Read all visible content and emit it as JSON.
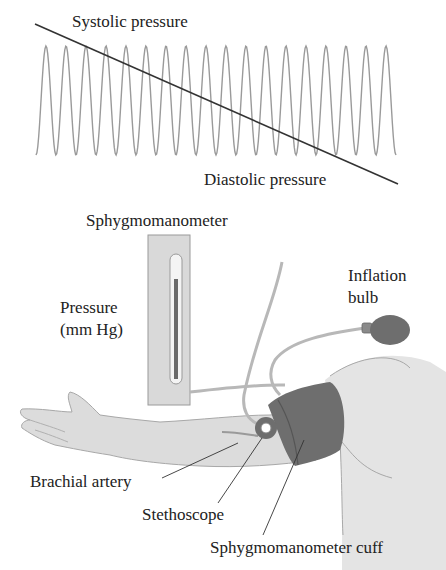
{
  "waveform": {
    "top_label": "Systolic pressure",
    "bottom_label": "Diastolic pressure",
    "peak_count": 18,
    "wave_color": "#9a9a9a",
    "line_color": "#333333"
  },
  "apparatus": {
    "manometer_label": "Sphygmomanometer",
    "pressure_label_line1": "Pressure",
    "pressure_label_line2": "(mm Hg)",
    "bulb_label_line1": "Inflation",
    "bulb_label_line2": "bulb",
    "artery_label": "Brachial artery",
    "stethoscope_label": "Stethoscope",
    "cuff_label": "Sphygmomanometer cuff"
  },
  "colors": {
    "skin": "#dcdcdc",
    "skin_outline": "#a8a8a8",
    "cuff": "#6e6e6e",
    "cuff_dark": "#555555",
    "manometer_box": "#d9d9d9",
    "mercury": "#6a6a6a",
    "tube": "#b8b8b8"
  }
}
